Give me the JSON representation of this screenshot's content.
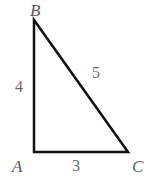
{
  "figure": {
    "kind": "right-triangle-diagram",
    "background_color": "#ffffff",
    "stroke_color": "#111111",
    "stroke_width": 2.5,
    "label_color": "#5a5a5a",
    "vertices": {
      "a": {
        "label": "A",
        "x": 34,
        "y": 152
      },
      "b": {
        "label": "B",
        "x": 34,
        "y": 20
      },
      "c": {
        "label": "C",
        "x": 128,
        "y": 152
      }
    },
    "sides": {
      "ab": {
        "label": "4",
        "from": "A",
        "to": "B"
      },
      "bc": {
        "label": "5",
        "from": "B",
        "to": "C"
      },
      "ac": {
        "label": "3",
        "from": "A",
        "to": "C"
      }
    }
  }
}
